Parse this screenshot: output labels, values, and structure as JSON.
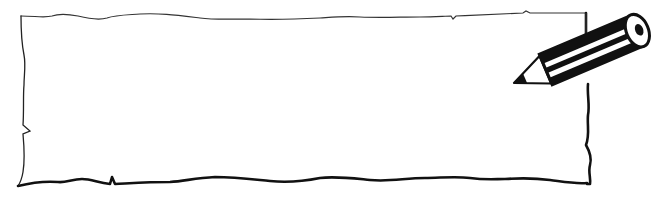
{
  "scene": {
    "description": "Hand-drawn blank note paper frame with a pencil",
    "paper_color": "#ffffff",
    "stroke_color": "#1a1a1a",
    "pencil": {
      "body_color": "#111111",
      "stripe_color": "#ffffff",
      "tip_color": "#111111"
    }
  }
}
